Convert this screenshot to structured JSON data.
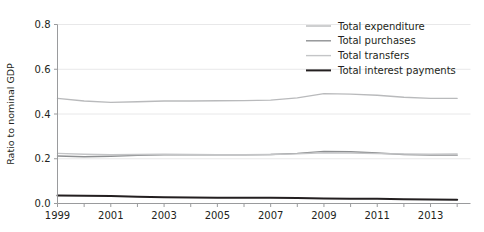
{
  "chart_data": {
    "type": "line",
    "title": "",
    "xlabel": "",
    "ylabel": "Ratio to nominal GDP",
    "xlim": [
      1999,
      2014.5
    ],
    "ylim": [
      0.0,
      0.8
    ],
    "grid": true,
    "legend_position": "top-right",
    "x_tick_labels": [
      "1999",
      "2001",
      "2003",
      "2005",
      "2007",
      "2009",
      "2011",
      "2013"
    ],
    "x_tick_values": [
      1999,
      2001,
      2003,
      2005,
      2007,
      2009,
      2011,
      2013
    ],
    "x_minor_ticks": [
      1999,
      2000,
      2001,
      2002,
      2003,
      2004,
      2005,
      2006,
      2007,
      2008,
      2009,
      2010,
      2011,
      2012,
      2013,
      2014
    ],
    "y_tick_labels": [
      "0.0",
      "0.2",
      "0.4",
      "0.6",
      "0.8"
    ],
    "y_tick_values": [
      0.0,
      0.2,
      0.4,
      0.6,
      0.8
    ],
    "x": [
      1999,
      2000,
      2001,
      2002,
      2003,
      2004,
      2005,
      2006,
      2007,
      2008,
      2009,
      2010,
      2011,
      2012,
      2013,
      2014
    ],
    "series": [
      {
        "name": "Total expenditure",
        "color": "#b9babc",
        "width": 1.4,
        "values": [
          0.47,
          0.458,
          0.452,
          0.455,
          0.458,
          0.458,
          0.459,
          0.46,
          0.462,
          0.472,
          0.491,
          0.489,
          0.484,
          0.475,
          0.47,
          0.47
        ]
      },
      {
        "name": "Total purchases",
        "color": "#8e9092",
        "width": 1.4,
        "values": [
          0.212,
          0.209,
          0.211,
          0.215,
          0.218,
          0.218,
          0.218,
          0.218,
          0.219,
          0.224,
          0.233,
          0.231,
          0.226,
          0.219,
          0.216,
          0.216
        ]
      },
      {
        "name": "Total transfers",
        "color": "#c4c5c7",
        "width": 1.4,
        "values": [
          0.224,
          0.22,
          0.218,
          0.219,
          0.22,
          0.219,
          0.218,
          0.218,
          0.219,
          0.222,
          0.227,
          0.226,
          0.223,
          0.221,
          0.22,
          0.221
        ]
      },
      {
        "name": "Total interest payments",
        "color": "#231f20",
        "width": 2.0,
        "values": [
          0.036,
          0.035,
          0.033,
          0.03,
          0.028,
          0.027,
          0.026,
          0.026,
          0.026,
          0.025,
          0.022,
          0.021,
          0.021,
          0.019,
          0.018,
          0.017
        ]
      }
    ]
  },
  "legend": {
    "items": [
      {
        "label": "Total expenditure"
      },
      {
        "label": "Total purchases"
      },
      {
        "label": "Total transfers"
      },
      {
        "label": "Total interest payments"
      }
    ]
  },
  "axes": {
    "y_title": "Ratio to nominal GDP"
  },
  "colors": {
    "axis": "#9a9b9d",
    "gridline": "#e8e8e9",
    "text": "#231f20",
    "background": "#ffffff"
  }
}
